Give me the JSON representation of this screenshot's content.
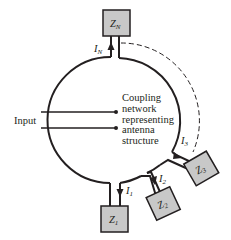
{
  "diagram": {
    "input_label": "Input",
    "network_label_lines": [
      "Coupling",
      "network",
      "representing",
      "antenna",
      "structure"
    ],
    "loads": [
      {
        "id": "ZN",
        "label": "Z",
        "subscript": "N",
        "current": "I",
        "current_subscript": "N"
      },
      {
        "id": "Z1",
        "label": "Z",
        "subscript": "1",
        "current": "I",
        "current_subscript": "1"
      },
      {
        "id": "Z2",
        "label": "Z",
        "subscript": "2",
        "current": "I",
        "current_subscript": "2"
      },
      {
        "id": "Z3",
        "label": "Z",
        "subscript": "3",
        "current": "I",
        "current_subscript": "3"
      }
    ],
    "colors": {
      "line": "#231f20",
      "box_fill": "#c8c8c8",
      "background": "#ffffff"
    }
  }
}
